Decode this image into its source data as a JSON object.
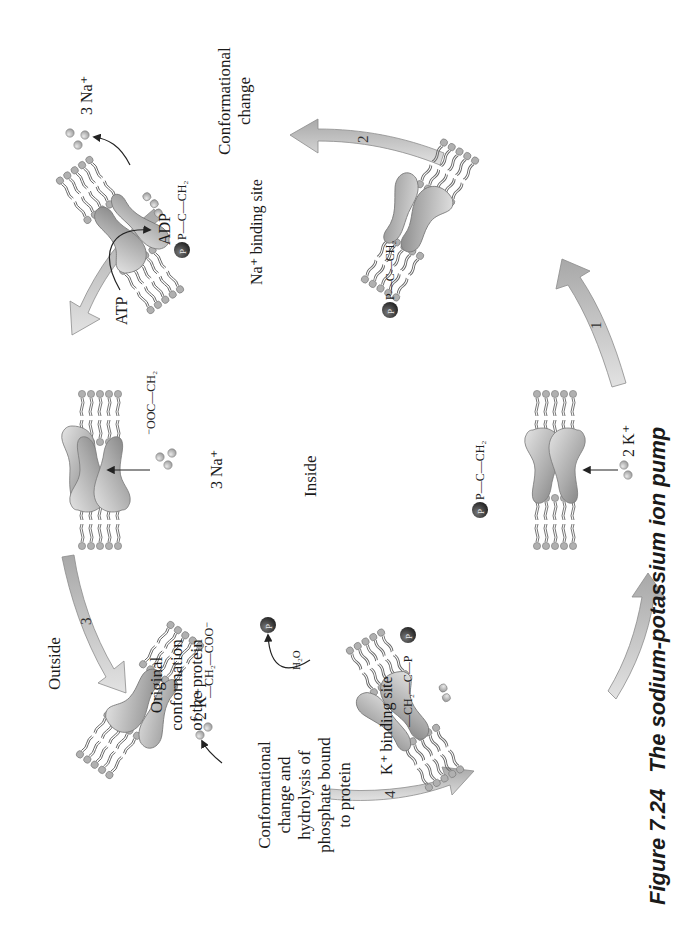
{
  "figure": {
    "caption_number": "Figure 7.24",
    "caption_title": "The sodium-potassium ion pump",
    "orientation": "rotated 90° counter-clockwise"
  },
  "regions": {
    "outside": "Outside",
    "inside": "Inside"
  },
  "steps": [
    {
      "number": "1",
      "label": ""
    },
    {
      "number": "2",
      "label_lines": [
        "Conformational",
        "change"
      ]
    },
    {
      "number": "3",
      "label": ""
    },
    {
      "number": "4",
      "label_lines": [
        "Conformational",
        "change and",
        "hydrolysis of",
        "phosphate bound",
        "to protein"
      ]
    }
  ],
  "labels": {
    "original_conformation": [
      "Original",
      "conformation",
      "of the protein"
    ],
    "na_binding_site": "Na⁺ binding site",
    "k_binding_site": "K⁺ binding site",
    "atp": "ATP",
    "adp": "ADP",
    "na_in": "3 Na⁺",
    "na_out": "3 Na⁺",
    "k_in": "2 K⁺",
    "k_out": "2 K⁺",
    "pi": "P",
    "pi_sub": "i",
    "h2o": "H₂O",
    "phosphate_symbol": "P"
  },
  "chemistry": {
    "carboxylate_left": "⁻OOC—CH₂",
    "carboxylate_right": "—CH₂—COO⁻",
    "acylphosphate_1": "P—C—CH₂",
    "acylphosphate_2": "P—C—CH₂",
    "acylphosphate_3": "P—C—CH₂",
    "acylphosphate_4": "—CH₂—C—P",
    "carbonyl_o": "O"
  },
  "colors": {
    "protein_light": "#d9d9d9",
    "protein_dark": "#8a8a8a",
    "arrow_fill": "#c4c4c4",
    "phosphate_ball": "#3a3a3a",
    "lipid_head": "#a8a8a8",
    "ion": "#b5b5b5",
    "text": "#1a1a1a"
  }
}
